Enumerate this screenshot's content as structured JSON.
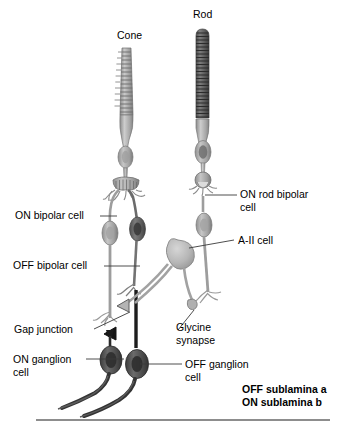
{
  "figure": {
    "title_cone": "Cone",
    "title_rod": "Rod",
    "labels": {
      "on_bipolar": "ON bipolar cell",
      "off_bipolar": "OFF bipolar cell",
      "on_rod_bipolar": "ON rod bipolar\ncell",
      "a2_cell": "A-II cell",
      "gap_junction": "Gap junction",
      "glycine_synapse": "Glycine\nsynapse",
      "on_ganglion": "ON ganglion\ncell",
      "off_ganglion": "OFF ganglion\ncell",
      "sublamina": "OFF sublamina a\nON sublamina b"
    },
    "colors": {
      "background": "#ffffff",
      "text": "#000000",
      "leader_line": "#444444",
      "cell_light": "#b8b8b8",
      "cell_mid": "#9a9a9a",
      "cell_dark": "#6e6e6e",
      "cell_darker": "#4a4a4a",
      "rod_outer": "#5f5f5f",
      "rule": "#8d8d8d",
      "synapse_black": "#111111"
    }
  }
}
